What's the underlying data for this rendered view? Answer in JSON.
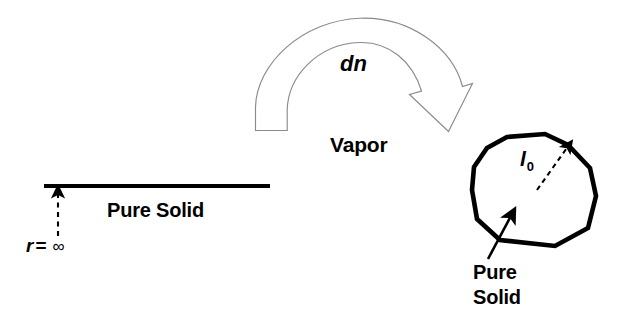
{
  "figure": {
    "background_color": "#ffffff",
    "stroke_color": "#000000",
    "arrow_outline_color": "#8a8a8a"
  },
  "labels": {
    "vapor": "Vapor",
    "dn": "dn",
    "pure_solid_flat": "Pure Solid",
    "radius_symbol": "r",
    "radius_equals": "=",
    "radius_value": "∞",
    "length_symbol": "l",
    "length_subscript": "0",
    "pure_particle_line1": "Pure",
    "pure_particle_line2": "Solid"
  },
  "elements": {
    "flat_surface": {
      "name": "flat solid surface line",
      "x1": 44,
      "y1": 186,
      "x2": 270,
      "y2": 186
    },
    "radius_indicator": {
      "name": "dashed infinite radius arrow",
      "x": 58,
      "y_top": 190,
      "y_bottom": 236
    },
    "vapor_transfer_arrow": {
      "name": "curved block arrow labelled dn",
      "tail_x": 271,
      "tail_y": 130,
      "apex_x": 360,
      "apex_y": 18,
      "tip_x": 448,
      "tip_y": 132
    },
    "particle_polygon": {
      "name": "faceted pure solid particle",
      "vertices": [
        [
          507,
          137
        ],
        [
          545,
          134
        ],
        [
          568,
          145
        ],
        [
          590,
          168
        ],
        [
          596,
          196
        ],
        [
          588,
          228
        ],
        [
          555,
          246
        ],
        [
          500,
          240
        ],
        [
          477,
          219
        ],
        [
          472,
          190
        ],
        [
          474,
          167
        ],
        [
          487,
          148
        ]
      ]
    },
    "radius_arrow_particle": {
      "name": "dashed radius arrow inside particle",
      "x1": 537,
      "y1": 190,
      "x2": 571,
      "y2": 143
    },
    "pure_solid_pointer": {
      "name": "leader arrow to particle edge",
      "x1": 489,
      "y1": 258,
      "x2": 513,
      "y2": 212
    }
  }
}
